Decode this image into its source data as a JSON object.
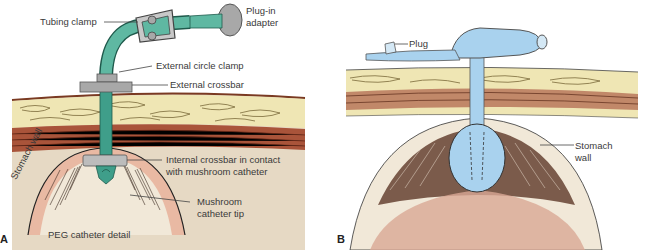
{
  "figure": {
    "panels": [
      {
        "letter": "A",
        "caption": "PEG catheter detail",
        "labels": {
          "tubing_clamp": "Tubing clamp",
          "plug_in_adapter_1": "Plug-in",
          "plug_in_adapter_2": "adapter",
          "external_circle_clamp": "External circle clamp",
          "external_crossbar": "External crossbar",
          "internal_crossbar_1": "Internal crossbar in contact",
          "internal_crossbar_2": "with mushroom catheter",
          "mushroom_tip_1": "Mushroom",
          "mushroom_tip_2": "catheter tip",
          "stomach_wall": "Stomach wall"
        }
      },
      {
        "letter": "B",
        "labels": {
          "plug": "Plug",
          "stomach_wall_1": "Stomach",
          "stomach_wall_2": "wall"
        }
      }
    ],
    "colors": {
      "tube_teal": "#3f9e8a",
      "clamp_gray": "#a8a8a8",
      "skin_red": "#a8472e",
      "fat_yellow": "#efe6b4",
      "muscle_brown": "#a9543a",
      "stomach_pink": "#e9b9a3",
      "cavity_beige": "#e6d9c4",
      "balloon_blue": "#a9d2ee"
    }
  }
}
